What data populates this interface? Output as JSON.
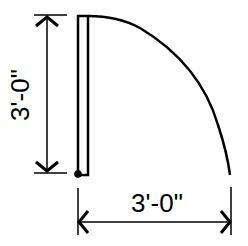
{
  "diagram": {
    "type": "door-swing-plan",
    "colors": {
      "line": "#000000",
      "background": "#ffffff"
    },
    "dimensions": {
      "vertical": {
        "label": "3'-0\""
      },
      "horizontal": {
        "label": "3'-0\""
      }
    },
    "elements": [
      "door-leaf",
      "swing-arc",
      "hinge-point",
      "vertical-dimension",
      "horizontal-dimension"
    ]
  }
}
